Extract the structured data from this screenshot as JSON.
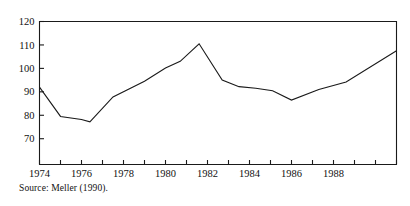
{
  "figure": {
    "source_note": "Source: Meller (1990)."
  },
  "chart_data": {
    "type": "line",
    "title": "",
    "xlabel": "",
    "ylabel": "",
    "xlim": [
      1974.0,
      1991.0
    ],
    "ylim": [
      59.0,
      120.0
    ],
    "grid": false,
    "legend": "none",
    "y_ticks": [
      70,
      80,
      90,
      100,
      110,
      120
    ],
    "y_tick_labels": [
      "70",
      "80",
      "90",
      "100",
      "110",
      "120"
    ],
    "x_ticks": [
      1974,
      1975,
      1976,
      1977,
      1978,
      1979,
      1980,
      1981,
      1982,
      1983,
      1984,
      1985,
      1986,
      1987,
      1988,
      1989,
      1990,
      1991
    ],
    "x_tick_labels": [
      "1974",
      "",
      "1976",
      "",
      "1978",
      "",
      "1980",
      "",
      "1982",
      "",
      "1984",
      "",
      "1986",
      "",
      "1988",
      "",
      "",
      ""
    ],
    "x_major_ticks": [
      1974,
      1976,
      1978,
      1980,
      1982,
      1984,
      1986,
      1988
    ],
    "line_color": "#1a1a1a",
    "series": [
      {
        "name": "index",
        "x": [
          1974.0,
          1975.0,
          1976.0,
          1976.4,
          1977.5,
          1979.0,
          1980.0,
          1980.7,
          1981.6,
          1982.7,
          1983.5,
          1984.3,
          1985.1,
          1986.0,
          1987.3,
          1988.6,
          1991.0
        ],
        "values": [
          92.0,
          79.5,
          78.2,
          77.2,
          87.8,
          94.5,
          100.2,
          103.0,
          110.5,
          95.0,
          92.2,
          91.5,
          90.5,
          86.5,
          91.0,
          94.2,
          107.5
        ]
      }
    ]
  }
}
